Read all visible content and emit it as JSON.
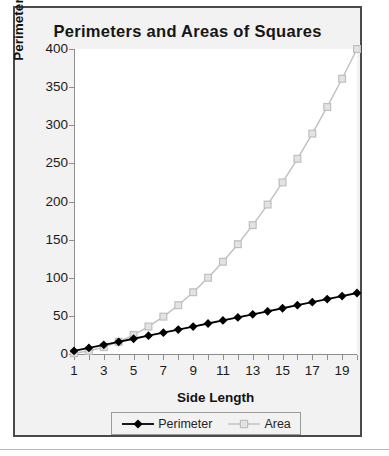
{
  "chart_data": {
    "type": "line",
    "title": "Perimeters and Areas of Squares",
    "xlabel": "Side Length",
    "ylabel": "Perimeter (Units) or Area (Square Units)",
    "x": [
      1,
      2,
      3,
      4,
      5,
      6,
      7,
      8,
      9,
      10,
      11,
      12,
      13,
      14,
      15,
      16,
      17,
      18,
      19,
      20
    ],
    "series": [
      {
        "name": "Perimeter",
        "color": "#000000",
        "marker": "diamond",
        "values": [
          4,
          8,
          12,
          16,
          20,
          24,
          28,
          32,
          36,
          40,
          44,
          48,
          52,
          56,
          60,
          64,
          68,
          72,
          76,
          80
        ]
      },
      {
        "name": "Area",
        "color": "#bfbfbf",
        "marker": "square",
        "values": [
          1,
          4,
          9,
          16,
          25,
          36,
          49,
          64,
          81,
          100,
          121,
          144,
          169,
          196,
          225,
          256,
          289,
          324,
          361,
          400
        ]
      }
    ],
    "xlim": [
      1,
      20
    ],
    "ylim": [
      0,
      400
    ],
    "ytick_labels": [
      "0",
      "50",
      "100",
      "150",
      "200",
      "250",
      "300",
      "350",
      "400"
    ],
    "ytick_values": [
      0,
      50,
      100,
      150,
      200,
      250,
      300,
      350,
      400
    ],
    "xtick_labels": [
      "1",
      "3",
      "5",
      "7",
      "9",
      "11",
      "13",
      "15",
      "17",
      "19"
    ],
    "xtick_values": [
      1,
      3,
      5,
      7,
      9,
      11,
      13,
      15,
      17,
      19
    ],
    "xtick_minor_values": [
      1,
      2,
      3,
      4,
      5,
      6,
      7,
      8,
      9,
      10,
      11,
      12,
      13,
      14,
      15,
      16,
      17,
      18,
      19,
      20
    ],
    "grid": false,
    "legend_position": "bottom"
  },
  "legend": {
    "entries": [
      {
        "label": "Perimeter"
      },
      {
        "label": "Area"
      }
    ]
  },
  "colors": {
    "frame_border": "#4a4a4a",
    "frame_background": "#f2f2f2",
    "plot_background": "#ffffff",
    "axis": "#8e8e8e",
    "perimeter": "#000000",
    "area": "#bfbfbf",
    "text": "#161616"
  }
}
